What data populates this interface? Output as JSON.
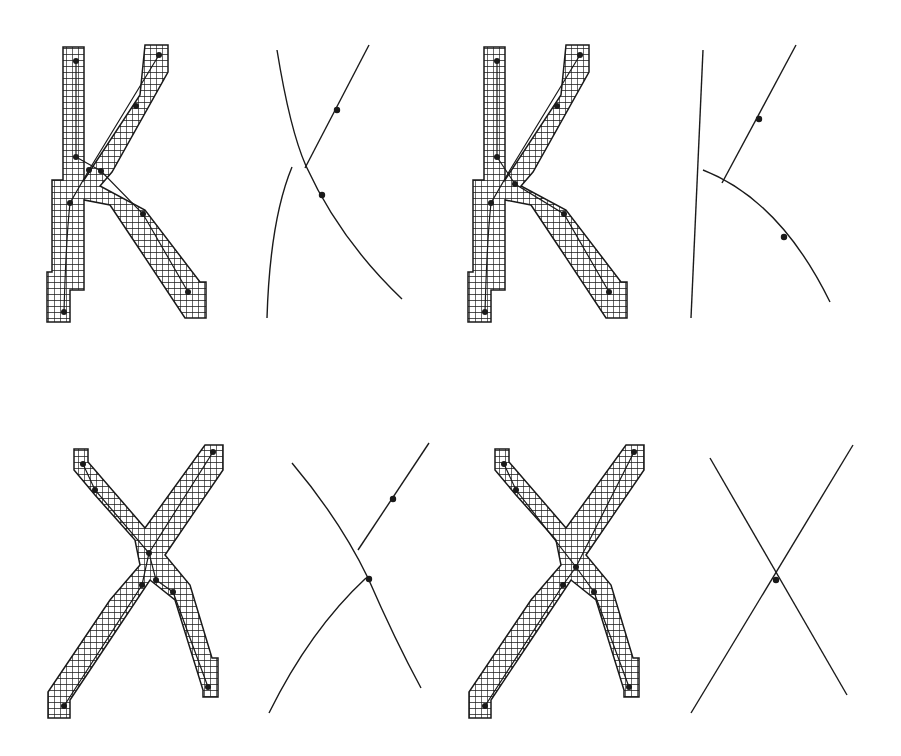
{
  "figure": {
    "colors": {
      "ink": "#1a1a1a",
      "background": "#ffffff"
    },
    "panels": [
      {
        "id": "k-raster-1",
        "letter": "K",
        "kind": "raster-skeleton"
      },
      {
        "id": "k-curves-1",
        "letter": "K",
        "kind": "curve-fit"
      },
      {
        "id": "k-raster-2",
        "letter": "K",
        "kind": "raster-skeleton"
      },
      {
        "id": "k-curves-2",
        "letter": "K",
        "kind": "curve-fit"
      },
      {
        "id": "x-raster-1",
        "letter": "X",
        "kind": "raster-skeleton"
      },
      {
        "id": "x-curves-1",
        "letter": "X",
        "kind": "curve-fit"
      },
      {
        "id": "x-raster-2",
        "letter": "X",
        "kind": "raster-skeleton"
      },
      {
        "id": "x-curves-2",
        "letter": "X",
        "kind": "curve-fit"
      }
    ]
  }
}
